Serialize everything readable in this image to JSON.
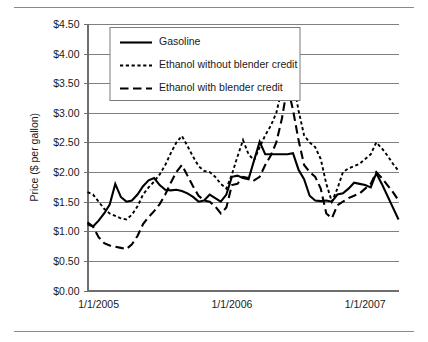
{
  "figure": {
    "has_top_rule": true,
    "has_bottom_rule": true,
    "background_color": "#ffffff",
    "line_color": "#000000",
    "grid_color": "#808080"
  },
  "chart_data": {
    "type": "line",
    "title": "",
    "xlabel": "",
    "ylabel": "Price ($ per gallon)",
    "ylim": [
      0,
      4.5
    ],
    "ytick_values": [
      0,
      0.5,
      1.0,
      1.5,
      2.0,
      2.5,
      3.0,
      3.5,
      4.0,
      4.5
    ],
    "ytick_labels": [
      "$0.00",
      "$0.50",
      "$1.00",
      "$1.50",
      "$2.00",
      "$2.50",
      "$3.00",
      "$3.50",
      "$4.00",
      "$4.50"
    ],
    "xtick_labels": [
      "1/1/2005",
      "1/1/2006",
      "1/1/2007"
    ],
    "xtick_positions": [
      2,
      26,
      50
    ],
    "xlim": [
      0,
      56
    ],
    "grid": "horizontal",
    "legend_position": "top-left-inside",
    "legend_entries": [
      {
        "label": "Gasoline",
        "style": "solid"
      },
      {
        "label": "Ethanol without blender credit",
        "style": "dotted"
      },
      {
        "label": "Ethanol with blender credit",
        "style": "dashed"
      }
    ],
    "x": [
      0,
      1,
      2,
      3,
      4,
      5,
      6,
      7,
      8,
      9,
      10,
      11,
      12,
      13,
      14,
      15,
      16,
      17,
      18,
      19,
      20,
      21,
      22,
      23,
      24,
      25,
      26,
      27,
      28,
      29,
      30,
      31,
      32,
      33,
      34,
      35,
      36,
      37,
      38,
      39,
      40,
      41,
      42,
      43,
      44,
      45,
      46,
      47,
      48,
      49,
      50,
      51,
      52,
      53,
      54,
      55,
      56
    ],
    "series": [
      {
        "name": "Gasoline",
        "style": "solid",
        "values": [
          1.12,
          1.08,
          1.18,
          1.3,
          1.45,
          1.8,
          1.58,
          1.5,
          1.52,
          1.62,
          1.76,
          1.86,
          1.9,
          1.78,
          1.7,
          1.69,
          1.7,
          1.68,
          1.64,
          1.58,
          1.5,
          1.52,
          1.62,
          1.56,
          1.5,
          1.62,
          1.92,
          1.94,
          1.9,
          1.88,
          2.2,
          2.51,
          2.3,
          2.3,
          2.3,
          2.3,
          2.3,
          2.32,
          2.04,
          1.88,
          1.6,
          1.52,
          1.51,
          1.52,
          1.5,
          1.62,
          1.64,
          1.72,
          1.82,
          1.8,
          1.78,
          1.74,
          1.98,
          1.8,
          1.6,
          1.4,
          1.2
        ]
      },
      {
        "name": "Ethanol without blender credit",
        "style": "dotted",
        "values": [
          1.66,
          1.62,
          1.5,
          1.38,
          1.3,
          1.26,
          1.22,
          1.2,
          1.28,
          1.42,
          1.62,
          1.74,
          1.84,
          1.96,
          2.12,
          2.32,
          2.5,
          2.61,
          2.44,
          2.26,
          2.1,
          2.02,
          2.0,
          1.92,
          1.8,
          1.72,
          1.96,
          2.26,
          2.54,
          2.3,
          2.2,
          2.42,
          2.62,
          2.78,
          3.0,
          3.4,
          3.98,
          3.55,
          3.04,
          2.62,
          2.5,
          2.42,
          2.22,
          1.8,
          1.5,
          1.72,
          2.0,
          2.06,
          2.1,
          2.14,
          2.22,
          2.3,
          2.5,
          2.4,
          2.28,
          2.14,
          2.02
        ]
      },
      {
        "name": "Ethanol with blender credit",
        "style": "dashed",
        "values": [
          1.15,
          1.08,
          0.9,
          0.8,
          0.76,
          0.74,
          0.72,
          0.7,
          0.78,
          0.92,
          1.12,
          1.24,
          1.34,
          1.46,
          1.62,
          1.82,
          2.0,
          2.12,
          1.94,
          1.76,
          1.6,
          1.52,
          1.5,
          1.42,
          1.3,
          1.4,
          1.78,
          1.8,
          1.92,
          1.9,
          1.86,
          1.92,
          2.12,
          2.28,
          2.5,
          2.9,
          3.45,
          3.05,
          2.54,
          2.12,
          2.0,
          1.92,
          1.72,
          1.3,
          1.22,
          1.44,
          1.5,
          1.56,
          1.6,
          1.64,
          1.72,
          1.8,
          2.0,
          1.9,
          1.78,
          1.66,
          1.52
        ]
      }
    ]
  }
}
